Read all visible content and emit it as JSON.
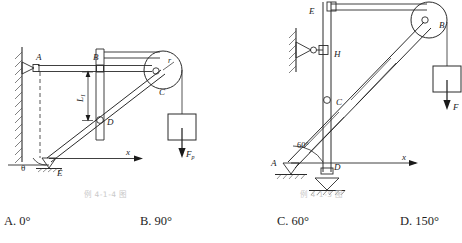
{
  "figures": {
    "left": {
      "caption": "例 4-1-4 图",
      "labels": {
        "A": "A",
        "B": "B",
        "C": "C",
        "D": "D",
        "E": "E",
        "r": "r",
        "L1": "L",
        "L1sub": "1",
        "theta": "θ",
        "x_axis": "x",
        "force": "F",
        "force_sub": "p"
      }
    },
    "right": {
      "caption": "例 4-1-5 图",
      "labels": {
        "A": "A",
        "B": "B",
        "C": "C",
        "D": "D",
        "E": "E",
        "H": "H",
        "angle": "60°",
        "x_axis": "x",
        "force": "F"
      }
    }
  },
  "options": [
    {
      "key": "A.",
      "value": "0°"
    },
    {
      "key": "B.",
      "value": "90°"
    },
    {
      "key": "C.",
      "value": "60°"
    },
    {
      "key": "D.",
      "value": "150°"
    }
  ],
  "colors": {
    "ink": "#1a1a1a",
    "caption": "#c9c9c9",
    "paper": "#ffffff"
  }
}
